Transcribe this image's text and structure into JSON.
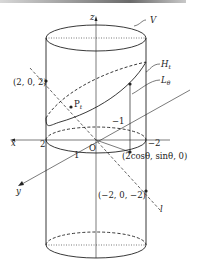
{
  "figure": {
    "labels": {
      "z_axis": "z",
      "x_axis": "x",
      "y_axis": "y",
      "cylinder": "V",
      "plane": "H",
      "plane_sub": "t",
      "line_L": "L",
      "line_L_sub": "θ",
      "line_l": "l",
      "point_P": "P",
      "point_P_sub": "t",
      "origin": "O",
      "pt_upper": "(2, 0, 2)",
      "pt_lower": "(−2, 0, −2)",
      "pt_circle": "(2cosθ, sinθ, 0)",
      "tick_x_pos": "2",
      "tick_x_neg": "−2",
      "tick_y_pos": "1",
      "tick_y_neg": "−1"
    },
    "colors": {
      "line": "#222222",
      "header_dark": "#6a6a6a"
    }
  }
}
